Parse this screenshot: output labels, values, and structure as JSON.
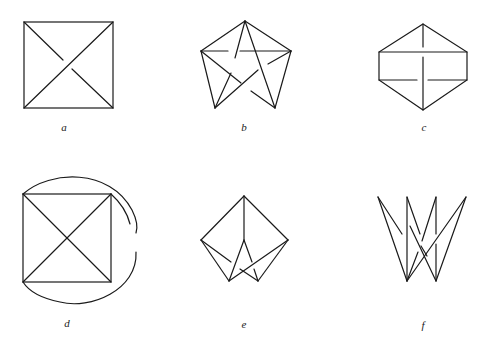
{
  "figures": [
    {
      "id": "a",
      "label": "a",
      "description": "Square with both diagonals; one diagonal passes under the other"
    },
    {
      "id": "b",
      "label": "b",
      "description": "Open pentagon with inscribed pentagram showing over/under crossings"
    },
    {
      "id": "c",
      "label": "c",
      "description": "Hexagon with vertical axis and two horizontal chords with crossings"
    },
    {
      "id": "d",
      "label": "d",
      "description": "Square with diagonals enclosed by a broken outer arc and inner arc"
    },
    {
      "id": "e",
      "label": "e",
      "description": "Kite shape with inner folded crossing lines"
    },
    {
      "id": "f",
      "label": "f",
      "description": "Crown-like zigzag of four peaks meeting at two lower points with crossings"
    }
  ],
  "stroke_color": "#1a1a1a",
  "background_color": "#ffffff"
}
